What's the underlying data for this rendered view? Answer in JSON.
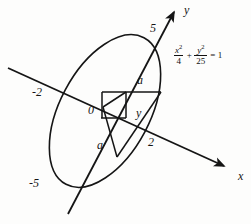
{
  "figure": {
    "kind": "analytic-geometry-diagram",
    "stroke_color": "#151515",
    "background_color": "#fdfdfc"
  },
  "axes": {
    "x_label": "x",
    "y_label": "y",
    "x_axis": {
      "start": [
        8,
        68
      ],
      "end": [
        228,
        168
      ],
      "arrow": true
    },
    "y_axis": {
      "start": [
        68,
        214
      ],
      "end": [
        176,
        9
      ],
      "arrow": true
    }
  },
  "ticks": [
    {
      "name": "x-negative-intercept",
      "label": "-2",
      "x": 32,
      "y": 86
    },
    {
      "name": "x-positive-intercept",
      "label": "2",
      "x": 148,
      "y": 136
    },
    {
      "name": "y-positive-intercept",
      "label": "5",
      "x": 150,
      "y": 22
    },
    {
      "name": "y-negative-intercept",
      "label": "-5",
      "x": 29,
      "y": 177
    }
  ],
  "origin": {
    "label": "0",
    "x": 88,
    "y": 104
  },
  "segments": [
    {
      "name": "segment-a-upper",
      "label": "a",
      "x": 137,
      "y": 74
    },
    {
      "name": "segment-a-lower",
      "label": "a",
      "x": 97,
      "y": 139
    },
    {
      "name": "segment-y",
      "label": "y",
      "x": 136,
      "y": 107
    }
  ],
  "equation": {
    "term1": {
      "numerator": "x",
      "numerator_exp": "2",
      "denominator": "4"
    },
    "operator": "+",
    "term2": {
      "numerator": "y",
      "numerator_exp": "2",
      "denominator": "25"
    },
    "equals": "= 1",
    "plain": "x^2/4 + y^2/25 = 1"
  },
  "ellipse": {
    "center": [
      105,
      111
    ],
    "semi_major": 83,
    "semi_minor": 45,
    "rotation_deg": -62
  }
}
